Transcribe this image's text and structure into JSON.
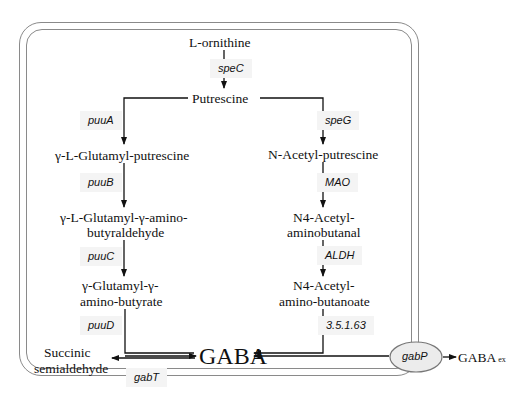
{
  "metabolites": {
    "ornithine": "L-ornithine",
    "putrescine": "Putrescine",
    "glutamyl_putrescine": "γ-L-Glutamyl-putrescine",
    "glutamyl_gaba_ald_1": "γ-L-Glutamyl-γ-amino-",
    "glutamyl_gaba_ald_2": "butyraldehyde",
    "glutamyl_gaba_1": "γ-Glutamyl-γ-",
    "glutamyl_gaba_2": "amino-butyrate",
    "acetyl_putrescine": "N-Acetyl-putrescine",
    "acetyl_aminobutanal_1": "N4-Acetyl-",
    "acetyl_aminobutanal_2": "aminobutanal",
    "acetyl_aminobutanoate_1": "N4-Acetyl-",
    "acetyl_aminobutanoate_2": "amino-butanoate",
    "gaba": "GABA",
    "succinic_1": "Succinic",
    "succinic_2": "semialdehyde",
    "gaba_ex": "GABA",
    "gaba_ex_sub": "ex"
  },
  "enzymes": {
    "speC": "speC",
    "puuA": "puuA",
    "speG": "speG",
    "puuB": "puuB",
    "MAO": "MAO",
    "puuC": "puuC",
    "ALDH": "ALDH",
    "puuD": "puuD",
    "ec": "3.5.1.63",
    "gabT": "gabT",
    "gabP": "gabP"
  }
}
